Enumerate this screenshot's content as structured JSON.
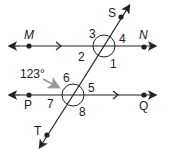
{
  "diagram": {
    "type": "parallel-lines-transversal",
    "lines": {
      "top": {
        "name": "MN",
        "points": [
          "M",
          "N"
        ]
      },
      "bottom": {
        "name": "PQ",
        "points": [
          "P",
          "Q"
        ]
      },
      "transversal": {
        "name": "ST",
        "points": [
          "S",
          "T"
        ]
      }
    },
    "points": {
      "M": "M",
      "N": "N",
      "P": "P",
      "Q": "Q",
      "S": "S",
      "T": "T"
    },
    "angles": [
      "1",
      "2",
      "3",
      "4",
      "5",
      "6",
      "7",
      "8"
    ],
    "given_angle": {
      "label": "123°",
      "points_to": "6"
    },
    "colors": {
      "line": "#222222",
      "arrow_callout": "#9a9a9a"
    }
  }
}
